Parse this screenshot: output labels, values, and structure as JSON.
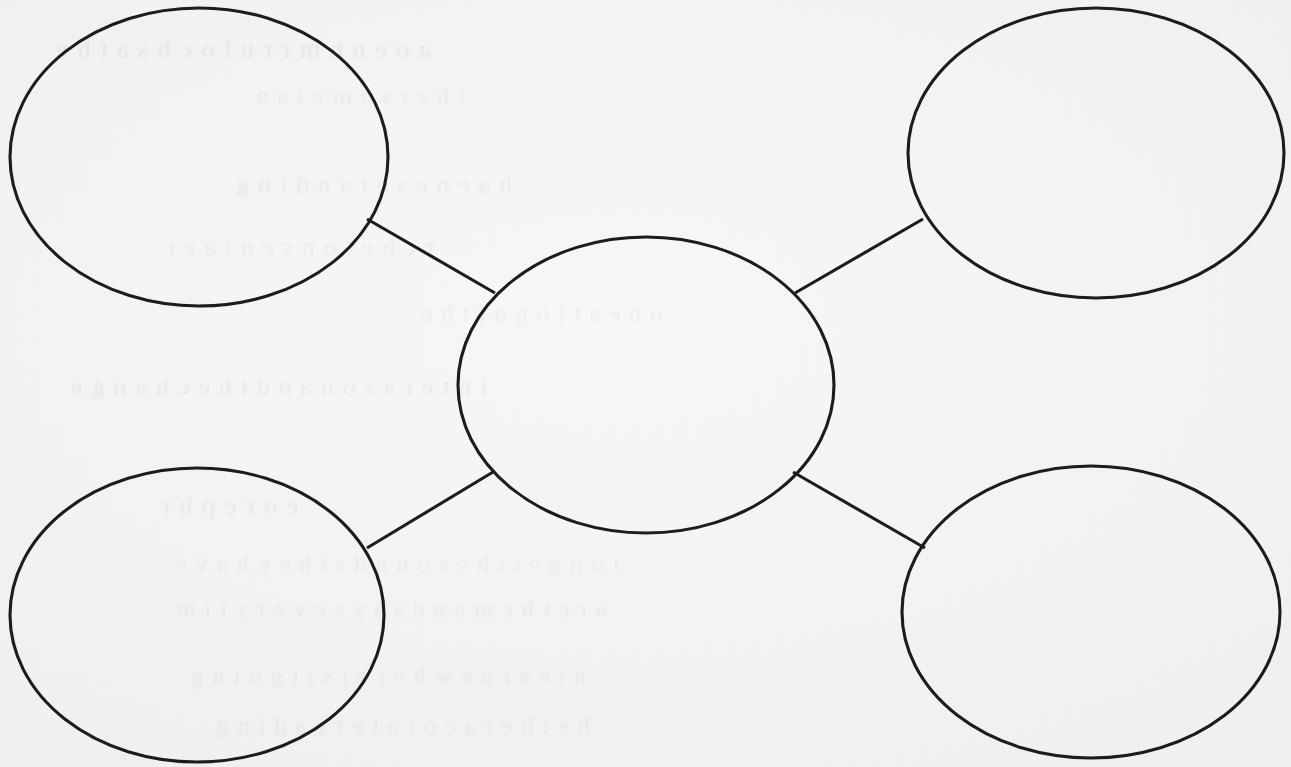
{
  "document": {
    "kind": "worksheet-graphic-organizer",
    "organizer_type": "concept-web",
    "paper_color": "#f4f4f4",
    "ink_color": "#1c1c1c"
  },
  "diagram": {
    "center_node": {
      "id": "center",
      "label": "",
      "cx": 646,
      "cy": 385,
      "rx": 188,
      "ry": 148
    },
    "satellite_nodes": [
      {
        "id": "top-left",
        "label": "",
        "cx": 199,
        "cy": 157,
        "rx": 189,
        "ry": 149
      },
      {
        "id": "top-right",
        "label": "",
        "cx": 1096,
        "cy": 153,
        "rx": 188,
        "ry": 145
      },
      {
        "id": "bottom-left",
        "label": "",
        "cx": 197,
        "cy": 615,
        "rx": 187,
        "ry": 147
      },
      {
        "id": "bottom-right",
        "label": "",
        "cx": 1091,
        "cy": 612,
        "rx": 189,
        "ry": 146
      }
    ],
    "connectors": [
      {
        "id": "center-to-top-left",
        "from": "center",
        "to": "top-left",
        "x1": 495,
        "y1": 293,
        "x2": 367,
        "y2": 219
      },
      {
        "id": "center-to-top-right",
        "from": "center",
        "to": "top-right",
        "x1": 795,
        "y1": 293,
        "x2": 923,
        "y2": 219
      },
      {
        "id": "center-to-bottom-left",
        "from": "center",
        "to": "bottom-left",
        "x1": 493,
        "y1": 472,
        "x2": 367,
        "y2": 548
      },
      {
        "id": "center-to-bottom-right",
        "from": "center",
        "to": "bottom-right",
        "x1": 793,
        "y1": 472,
        "x2": 925,
        "y2": 548
      }
    ]
  },
  "bleed_through": {
    "note": "Faint mirrored ghost text showing through from the reverse side of the scanned sheet; not legible.",
    "lines": [
      {
        "text": "a o e n  n m  r  r  u  l o c h s  a t  h e",
        "x": 55,
        "y": 34,
        "size": 27,
        "opacity": 0.055
      },
      {
        "text": "t  h e  r  s   o  m  e  i  a  n",
        "x": 255,
        "y": 82,
        "size": 25,
        "opacity": 0.045
      },
      {
        "text": "h  a  e  n  e  s  e  t  a  n  d  i  n  g",
        "x": 235,
        "y": 170,
        "size": 26,
        "opacity": 0.05
      },
      {
        "text": "r  c  h  e   t  o  n  s  e  n  t   a  e  r",
        "x": 165,
        "y": 232,
        "size": 26,
        "opacity": 0.048
      },
      {
        "text": "o  n  e   a  t  i  o  n   o  f   t  h  e",
        "x": 420,
        "y": 300,
        "size": 25,
        "opacity": 0.042
      },
      {
        "text": "i  n  t  e  r   a   s  o  n   a  n  d  t  h  e   c  h  a  n  g  e",
        "x": 70,
        "y": 372,
        "size": 26,
        "opacity": 0.05
      },
      {
        "text": "e   o  r  e  p  h  r",
        "x": 160,
        "y": 490,
        "size": 27,
        "opacity": 0.048
      },
      {
        "text": "t  o  n  g  e  t   t  h  e   s  o  u  n  d  s   t  h  e  y   h  a  v  e",
        "x": 175,
        "y": 550,
        "size": 25,
        "opacity": 0.045
      },
      {
        "text": "a  r  e   t  h  e  m   a  n  d   s  a  y  s   e  v  e  r  y   t  i  m",
        "x": 175,
        "y": 595,
        "size": 25,
        "opacity": 0.043
      },
      {
        "text": "n   t  e  a   r   p  e   w  h  e  r  e   i  s   i  t   g  o  i  n  g",
        "x": 190,
        "y": 662,
        "size": 25,
        "opacity": 0.044
      },
      {
        "text": "h  e  t  h  e  r   a   c  o  r   a  t  e   r  e  a  d  i  n  g",
        "x": 215,
        "y": 712,
        "size": 25,
        "opacity": 0.042
      }
    ]
  }
}
